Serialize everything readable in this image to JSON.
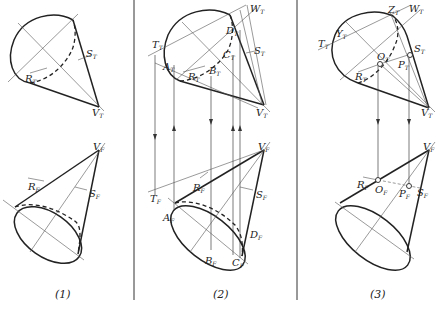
{
  "figure": {
    "panels": [
      {
        "caption": "(1)",
        "top_view_labels": {
          "S": "S",
          "S_sub": "T",
          "R": "R",
          "R_sub": "T",
          "V": "V",
          "V_sub": "T"
        },
        "front_view_labels": {
          "V": "V",
          "V_sub": "F",
          "R": "R",
          "R_sub": "F",
          "S": "S",
          "S_sub": "F"
        }
      },
      {
        "caption": "(2)",
        "top_view_labels": {
          "W": "W",
          "W_sub": "T",
          "D": "D",
          "D_sub": "T",
          "T": "T",
          "T_sub": "T",
          "S": "S",
          "S_sub": "T",
          "C": "C",
          "C_sub": "T",
          "A": "A",
          "A_sub": "T",
          "B": "B",
          "B_sub": "T",
          "R": "R",
          "R_sub": "T",
          "V": "V",
          "V_sub": "T"
        },
        "front_view_labels": {
          "V": "V",
          "V_sub": "F",
          "R": "R",
          "R_sub": "F",
          "T": "T",
          "T_sub": "F",
          "S": "S",
          "S_sub": "F",
          "A": "A",
          "A_sub": "F",
          "D": "D",
          "D_sub": "F",
          "B": "B",
          "B_sub": "F",
          "C": "C",
          "C_sub": "F"
        }
      },
      {
        "caption": "(3)",
        "top_view_labels": {
          "Z": "Z",
          "Z_sub": "T",
          "W": "W",
          "W_sub": "T",
          "T": "T",
          "T_sub": "T",
          "Y": "Y",
          "Y_sub": "T",
          "S": "S",
          "S_sub": "T",
          "O": "O",
          "O_sub": "T",
          "P": "P",
          "P_sub": "T",
          "R": "R",
          "R_sub": "T",
          "V": "V",
          "V_sub": "T"
        },
        "front_view_labels": {
          "V": "V",
          "V_sub": "F",
          "R": "R",
          "R_sub": "F",
          "O": "O",
          "O_sub": "F",
          "P": "P",
          "P_sub": "F",
          "S": "S",
          "S_sub": "F"
        }
      }
    ]
  }
}
